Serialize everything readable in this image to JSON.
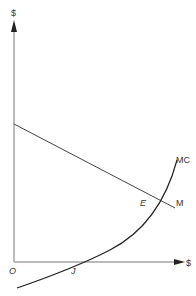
{
  "diagram": {
    "y_axis_label": "$",
    "x_axis_label": "$",
    "origin_label": "O",
    "curves": [
      {
        "id": "M",
        "label": "M",
        "type": "line"
      },
      {
        "id": "MC",
        "label": "MC",
        "type": "curve"
      }
    ],
    "points": [
      {
        "id": "E",
        "label": "E"
      },
      {
        "id": "J",
        "label": "J"
      }
    ]
  }
}
